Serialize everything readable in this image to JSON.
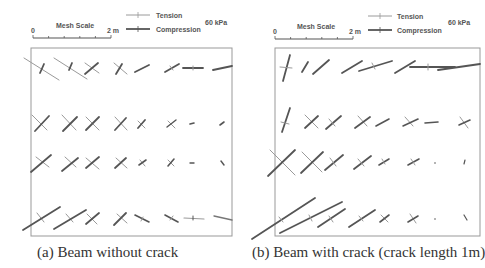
{
  "figure": {
    "panels": [
      {
        "id": "a",
        "caption": "(a) Beam without crack",
        "legend": {
          "scale_title": "Mesh Scale",
          "scale_start": "0",
          "scale_end": "2 m",
          "tension_label": "Tension",
          "compression_label": "Compression",
          "stress_scale": "60 kPa"
        }
      },
      {
        "id": "b",
        "caption": "(b) Beam with crack (crack length 1m)",
        "legend": {
          "scale_title": "Mesh Scale",
          "scale_start": "0",
          "scale_end": "2 m",
          "tension_label": "Tension",
          "compression_label": "Compression",
          "stress_scale": "60 kPa"
        }
      }
    ],
    "colors": {
      "tension": "#9a9a9a",
      "compression": "#555555",
      "frame": "#999999",
      "text": "#555555"
    }
  }
}
